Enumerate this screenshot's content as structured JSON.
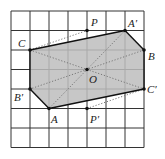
{
  "diagram": {
    "type": "grid-rotation-figure",
    "grid": {
      "columns": 7,
      "rows": 7,
      "origin_px": [
        11,
        11
      ],
      "cell_w_px": 19,
      "cell_h_px": 19.5,
      "line_color": "#333333"
    },
    "shaded_polygon": {
      "vertices": [
        "C",
        "A'",
        "B",
        "C'",
        "A",
        "B'"
      ],
      "fill": "#bdbdbd"
    },
    "points": [
      {
        "name": "C",
        "label": "C",
        "grid": [
          1,
          2
        ],
        "label_offset": [
          -12,
          -3
        ]
      },
      {
        "name": "P",
        "label": "P",
        "grid": [
          4,
          1
        ],
        "label_offset": [
          4,
          -5
        ]
      },
      {
        "name": "A'",
        "label": "A′",
        "grid": [
          6,
          1
        ],
        "label_offset": [
          3,
          -4
        ]
      },
      {
        "name": "B",
        "label": "B",
        "grid": [
          7,
          2
        ],
        "label_offset": [
          4,
          10
        ]
      },
      {
        "name": "O",
        "label": "O",
        "grid": [
          4,
          3
        ],
        "label_offset": [
          2,
          13
        ]
      },
      {
        "name": "B'",
        "label": "B′",
        "grid": [
          1,
          4
        ],
        "label_offset": [
          -16,
          12
        ]
      },
      {
        "name": "C'",
        "label": "C′",
        "grid": [
          7,
          4
        ],
        "label_offset": [
          3,
          4
        ]
      },
      {
        "name": "A",
        "label": "A",
        "grid": [
          2,
          5
        ],
        "label_offset": [
          2,
          14
        ]
      },
      {
        "name": "P'",
        "label": "P′",
        "grid": [
          4,
          5
        ],
        "label_offset": [
          3,
          14
        ]
      }
    ],
    "solid_edges": [
      [
        "C",
        "A'"
      ],
      [
        "A'",
        "B"
      ],
      [
        "B",
        "C'"
      ],
      [
        "C'",
        "A"
      ],
      [
        "A",
        "B'"
      ],
      [
        "B'",
        "C"
      ]
    ],
    "dotted_segments": [
      [
        "C",
        "P"
      ],
      [
        "P'",
        "C'"
      ],
      [
        "A",
        "A'"
      ],
      [
        "B",
        "B'"
      ],
      [
        "C",
        "C'"
      ]
    ],
    "center": "O"
  }
}
